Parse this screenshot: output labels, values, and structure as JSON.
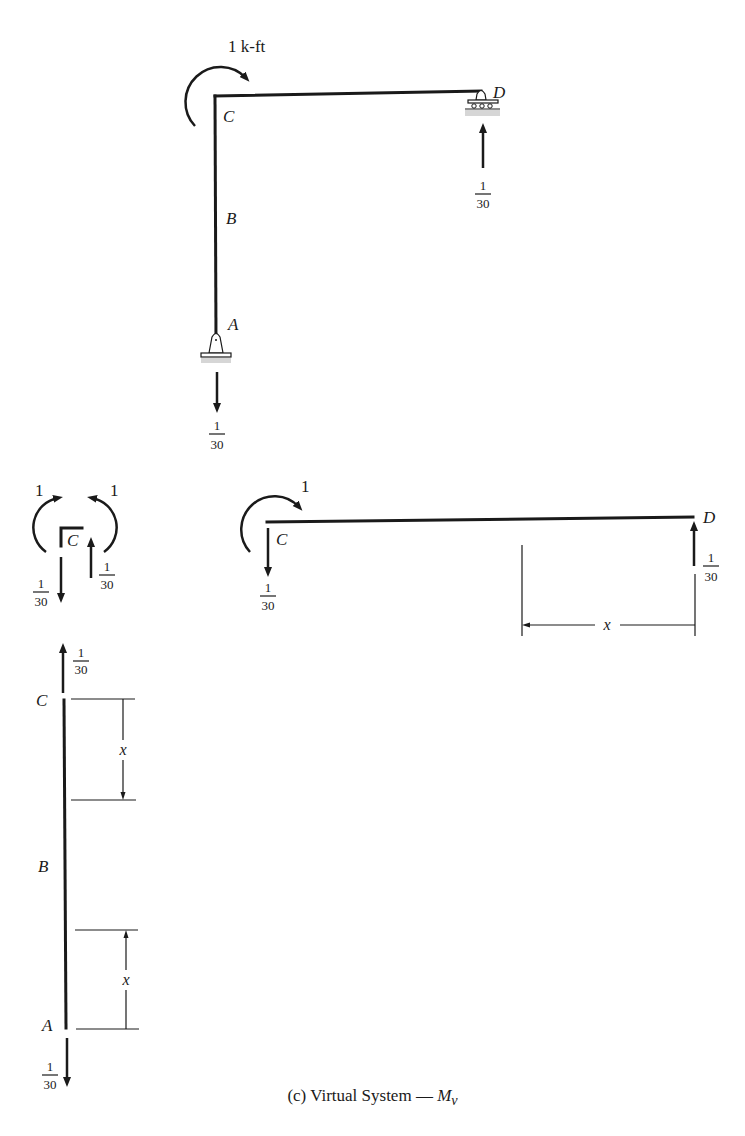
{
  "figure": {
    "caption_prefix": "(c) Virtual System — ",
    "caption_symbol": "M",
    "caption_subscript": "v"
  },
  "frame": {
    "moment_label": "1 k-ft",
    "nodes": {
      "A": "A",
      "B": "B",
      "C": "C",
      "D": "D"
    },
    "reaction_A": {
      "num": "1",
      "den": "30",
      "direction": "down"
    },
    "reaction_D": {
      "num": "1",
      "den": "30",
      "direction": "up"
    },
    "supports": {
      "A": "pin",
      "D": "roller"
    }
  },
  "joint_C": {
    "label": "C",
    "moment_left": "1",
    "moment_right": "1",
    "force_left": {
      "num": "1",
      "den": "30",
      "direction": "down"
    },
    "force_right": {
      "num": "1",
      "den": "30",
      "direction": "up"
    }
  },
  "beam_CD": {
    "moment_label": "1",
    "label_C": "C",
    "label_D": "D",
    "force_C": {
      "num": "1",
      "den": "30",
      "direction": "down"
    },
    "force_D": {
      "num": "1",
      "den": "30",
      "direction": "up"
    },
    "dimension_label": "x"
  },
  "column_AC": {
    "label_C": "C",
    "label_B": "B",
    "label_A": "A",
    "force_top": {
      "num": "1",
      "den": "30",
      "direction": "up"
    },
    "force_bottom": {
      "num": "1",
      "den": "30",
      "direction": "down"
    },
    "dim_top_label": "x",
    "dim_bottom_label": "x"
  }
}
